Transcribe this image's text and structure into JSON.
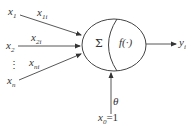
{
  "diagram": {
    "type": "neuron-model",
    "inputs": [
      {
        "name": "x",
        "sub": "1",
        "weight": "x",
        "weight_sub": "1i"
      },
      {
        "name": "x",
        "sub": "2",
        "weight": "x",
        "weight_sub": "2i"
      },
      {
        "name": "⋮",
        "sub": "",
        "weight": "",
        "weight_sub": ""
      },
      {
        "name": "x",
        "sub": "n",
        "weight": "x",
        "weight_sub": "ni"
      }
    ],
    "node": {
      "sum_symbol": "Σ",
      "activation": "f(·)"
    },
    "output": {
      "name": "y",
      "sub": "i"
    },
    "bias": {
      "threshold": "θ",
      "input_name": "x",
      "input_sub": "0",
      "input_value": "=1"
    },
    "colors": {
      "stroke": "#333333",
      "background": "#ffffff"
    }
  }
}
